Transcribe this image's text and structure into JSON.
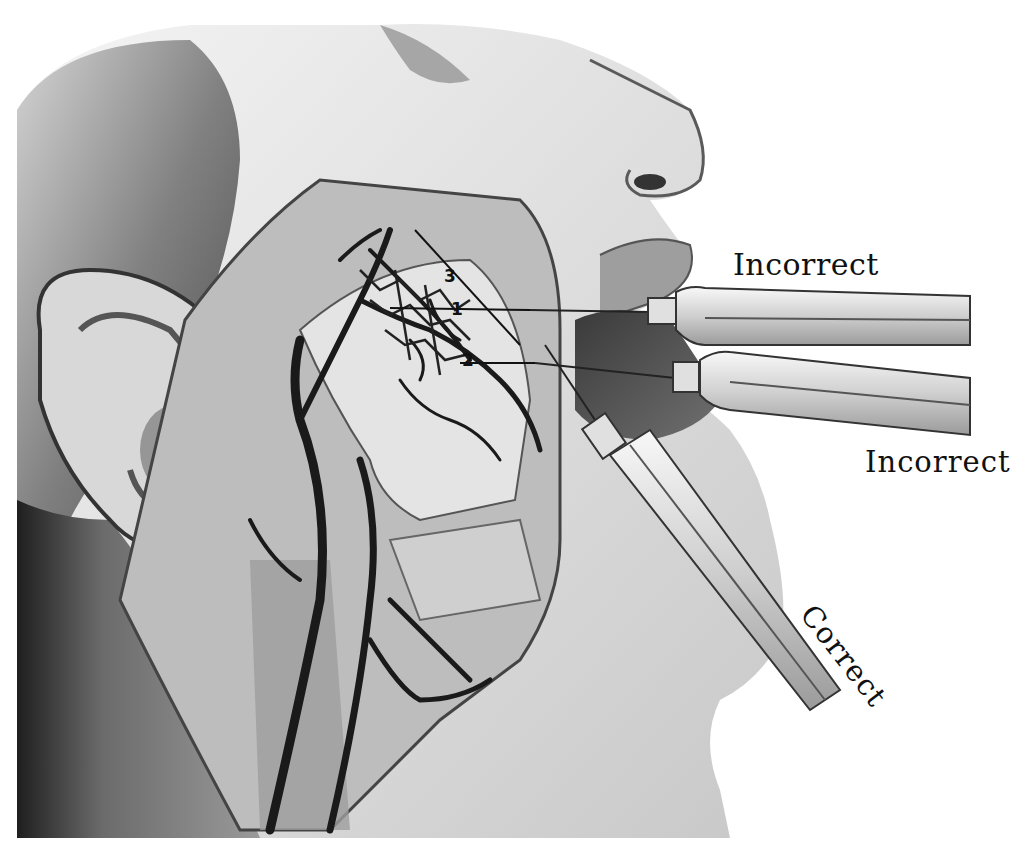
{
  "figure": {
    "labels": {
      "incorrect_upper": "Incorrect",
      "incorrect_lower": "Incorrect",
      "correct": "Correct"
    },
    "markers": {
      "m1": "1",
      "m2": "2",
      "m3": "3"
    },
    "palette": {
      "background": "#ffffff",
      "ink": "#111111",
      "skin_light": "#e6e6e6",
      "skin_mid": "#b5b5b5",
      "shadow": "#4a4a4a",
      "vessel": "#1a1a1a"
    }
  }
}
